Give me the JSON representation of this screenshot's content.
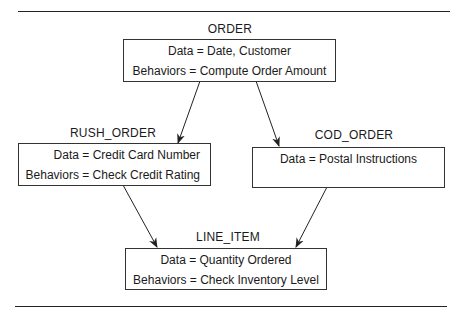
{
  "diagram": {
    "nodes": [
      {
        "id": "order",
        "title": "ORDER",
        "data": "Data = Date, Customer",
        "behaviors": "Behaviors = Compute Order Amount"
      },
      {
        "id": "rush_order",
        "title": "RUSH_ORDER",
        "data": "Data = Credit Card Number",
        "behaviors": "Behaviors = Check Credit Rating"
      },
      {
        "id": "cod_order",
        "title": "COD_ORDER",
        "data": "Data = Postal Instructions",
        "behaviors": ""
      },
      {
        "id": "line_item",
        "title": "LINE_ITEM",
        "data": "Data = Quantity Ordered",
        "behaviors": "Behaviors = Check Inventory Level"
      }
    ],
    "edges": [
      {
        "from": "order",
        "to": "rush_order"
      },
      {
        "from": "order",
        "to": "cod_order"
      },
      {
        "from": "rush_order",
        "to": "line_item"
      },
      {
        "from": "cod_order",
        "to": "line_item"
      }
    ]
  }
}
